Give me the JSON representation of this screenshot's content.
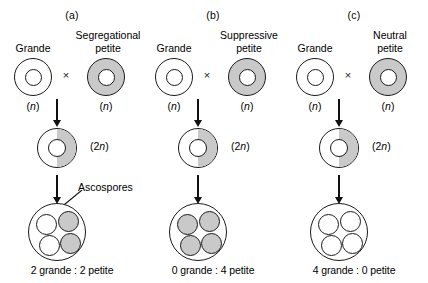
{
  "figure": {
    "colors": {
      "petite_fill": "#c9c9c9",
      "grande_fill": "#ffffff",
      "outline": "#1a1a1a"
    },
    "cross_symbol": "×",
    "ascospores_label": "Ascospores",
    "ploidy_haploid": "(n)",
    "ploidy_diploid": "(2n)"
  },
  "panels": [
    {
      "label": "(a)",
      "parent_left": "Grande",
      "parent_right": "Segregational\npetite",
      "parent_left_ploidy": "(n)",
      "parent_right_ploidy": "(n)",
      "zygote_ploidy": "(2n)",
      "zygote_shading": "half-gray",
      "spores": [
        "white",
        "gray",
        "white",
        "gray"
      ],
      "ratio": "2 grande : 2 petite",
      "show_ascospores_label": true
    },
    {
      "label": "(b)",
      "parent_left": "Grande",
      "parent_right": "Suppressive\npetite",
      "parent_left_ploidy": "(n)",
      "parent_right_ploidy": "(n)",
      "zygote_ploidy": "(2n)",
      "zygote_shading": "half-gray",
      "spores": [
        "gray",
        "gray",
        "gray",
        "gray"
      ],
      "ratio": "0 grande : 4 petite",
      "show_ascospores_label": false
    },
    {
      "label": "(c)",
      "parent_left": "Grande",
      "parent_right": "Neutral\npetite",
      "parent_left_ploidy": "(n)",
      "parent_right_ploidy": "(n)",
      "zygote_ploidy": "(2n)",
      "zygote_shading": "half-gray",
      "spores": [
        "white",
        "white",
        "white",
        "white"
      ],
      "ratio": "4 grande : 0 petite",
      "show_ascospores_label": false
    }
  ]
}
